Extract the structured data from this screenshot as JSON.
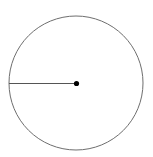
{
  "diagram": {
    "type": "circle-with-radius",
    "canvas": {
      "width": 153,
      "height": 157
    },
    "circle": {
      "cx": 76,
      "cy": 83,
      "r": 67,
      "stroke": "#6e6e6e",
      "stroke_width": 1
    },
    "center_point": {
      "cx": 76.5,
      "cy": 83.5,
      "r": 2.6,
      "fill": "#000000"
    },
    "radius_line": {
      "x1": 9,
      "y1": 83.5,
      "x2": 76.5,
      "y2": 83.5,
      "stroke": "#555555",
      "stroke_width": 1
    },
    "labels": []
  }
}
